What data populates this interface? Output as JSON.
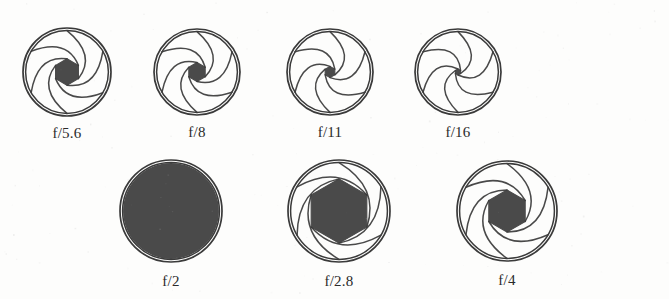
{
  "figure": {
    "background_color": "#fdfdfc",
    "ink_color": "#3a3a3a",
    "opening_fill_color": "#4a4a4a",
    "blade_count": 6
  },
  "rows": [
    {
      "name": "top-row",
      "apertures": [
        {
          "label": "f/5.6",
          "f_number": 5.6,
          "cx": 67,
          "cy": 72,
          "outer_radius": 44,
          "opening_ratio": 0.3,
          "fully_open": false,
          "blade_rotation": 0
        },
        {
          "label": "f/8",
          "f_number": 8,
          "cx": 197,
          "cy": 72,
          "outer_radius": 43,
          "opening_ratio": 0.22,
          "fully_open": false,
          "blade_rotation": 0
        },
        {
          "label": "f/11",
          "f_number": 11,
          "cx": 330,
          "cy": 72,
          "outer_radius": 43,
          "opening_ratio": 0.13,
          "fully_open": false,
          "blade_rotation": 0
        },
        {
          "label": "f/16",
          "f_number": 16,
          "cx": 458,
          "cy": 72,
          "outer_radius": 43,
          "opening_ratio": 0.07,
          "fully_open": false,
          "blade_rotation": 0
        }
      ]
    },
    {
      "name": "bottom-row",
      "apertures": [
        {
          "label": "f/2",
          "f_number": 2,
          "cx": 171,
          "cy": 211,
          "outer_radius": 51,
          "opening_ratio": 1.0,
          "fully_open": true,
          "blade_rotation": 0
        },
        {
          "label": "f/2.8",
          "f_number": 2.8,
          "cx": 339,
          "cy": 211,
          "outer_radius": 51,
          "opening_ratio": 0.63,
          "fully_open": false,
          "blade_rotation": 0
        },
        {
          "label": "f/4",
          "f_number": 4,
          "cx": 507,
          "cy": 211,
          "outer_radius": 50,
          "opening_ratio": 0.42,
          "fully_open": false,
          "blade_rotation": 0
        }
      ]
    }
  ]
}
